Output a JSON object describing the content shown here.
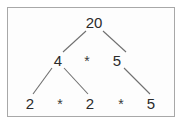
{
  "diagram": {
    "type": "binary-factor-tree",
    "background_color": "#fdfdfd",
    "border_color": "#a8a8a8",
    "text_color": "#2b2b2b",
    "edge_color": "#6f6f6f",
    "levels": [
      {
        "level": 0,
        "nodes": [
          {
            "id": "root",
            "label": "20",
            "x": 94,
            "y": 22
          }
        ],
        "operators": []
      },
      {
        "level": 1,
        "nodes": [
          {
            "id": "n4",
            "label": "4",
            "x": 58,
            "y": 60
          },
          {
            "id": "n5a",
            "label": "5",
            "x": 117,
            "y": 60
          }
        ],
        "operators": [
          {
            "id": "op-mid",
            "label": "*",
            "x": 87,
            "y": 61
          }
        ]
      },
      {
        "level": 2,
        "nodes": [
          {
            "id": "n2a",
            "label": "2",
            "x": 30,
            "y": 103
          },
          {
            "id": "n2b",
            "label": "2",
            "x": 90,
            "y": 103
          },
          {
            "id": "n5b",
            "label": "5",
            "x": 151,
            "y": 103
          }
        ],
        "operators": [
          {
            "id": "op-left",
            "label": "*",
            "x": 60,
            "y": 104
          },
          {
            "id": "op-right",
            "label": "*",
            "x": 121,
            "y": 104
          }
        ]
      }
    ],
    "edges": [
      {
        "id": "edge-root-left",
        "from": "root",
        "to": "n4",
        "x1": 86,
        "y1": 31,
        "x2": 63,
        "y2": 52
      },
      {
        "id": "edge-root-right",
        "from": "root",
        "to": "n5a",
        "x1": 103,
        "y1": 31,
        "x2": 126,
        "y2": 52
      },
      {
        "id": "edge-n4-left",
        "from": "n4",
        "to": "n2a",
        "x1": 52,
        "y1": 68,
        "x2": 33,
        "y2": 94
      },
      {
        "id": "edge-n4-right",
        "from": "n4",
        "to": "n2b",
        "x1": 64,
        "y1": 68,
        "x2": 88,
        "y2": 94
      },
      {
        "id": "edge-n5a-right",
        "from": "n5a",
        "to": "n5b",
        "x1": 124,
        "y1": 68,
        "x2": 150,
        "y2": 94
      }
    ],
    "expression": "20 = 4 * 5 = 2 * 2 * 5"
  }
}
